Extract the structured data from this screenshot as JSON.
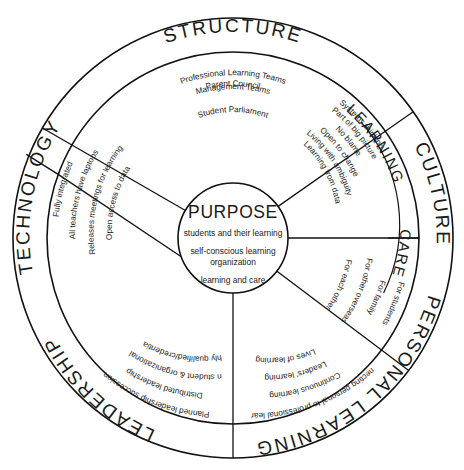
{
  "diagram": {
    "center": {
      "name": "purpose-core",
      "title": "PURPOSE",
      "lines": [
        "students and their learning",
        "self-conscious learning",
        "organization",
        "learning and care"
      ]
    },
    "outer_ring_labels": [
      {
        "id": "structure",
        "text": "STRUCTURE"
      },
      {
        "id": "culture",
        "text": "CULTURE"
      },
      {
        "id": "personal-learning",
        "text": "PERSONAL LEARNING"
      },
      {
        "id": "leadership",
        "text": "LEADERSHIP"
      },
      {
        "id": "technology",
        "text": "TECHNOLOGY"
      }
    ],
    "band_labels": [
      {
        "id": "learning",
        "text": "LEARNING"
      },
      {
        "id": "care",
        "text": "CARE"
      }
    ],
    "sectors": [
      {
        "id": "structure",
        "label": "STRUCTURE",
        "items": [
          "Professional Learning Teams",
          "Management Teams",
          "Parent Council",
          "Student Parliament"
        ]
      },
      {
        "id": "learning",
        "label": "LEARNING",
        "items": [
          "Systems thinking",
          "Part of big picture",
          "No blame",
          "Open to change",
          "Living with ambiguity",
          "Learning from data"
        ]
      },
      {
        "id": "care",
        "label": "CARE",
        "items": [
          "For students",
          "For family",
          "For other overseas",
          "For each other"
        ]
      },
      {
        "id": "personal-learning",
        "label": "PERSONAL LEARNING",
        "items": [
          "Connecting personal to professional learning",
          "Continuous learning",
          "Leaders' learning",
          "Lives of learning"
        ]
      },
      {
        "id": "leadership",
        "label": "LEADERSHIP",
        "items": [
          "Planned leadership succession",
          "Distributed leadership",
          "Focus on student & organizational learning",
          "Highly qualified/credentialed"
        ]
      },
      {
        "id": "technology",
        "label": "TECHNOLOGY",
        "items": [
          "Fully integrated",
          "All teachers have laptops",
          "Releases meetings for learning",
          "Open access to data"
        ]
      }
    ],
    "colors": {
      "stroke": "#111111",
      "background": "#ffffff",
      "text": "#1a1a1a"
    }
  }
}
